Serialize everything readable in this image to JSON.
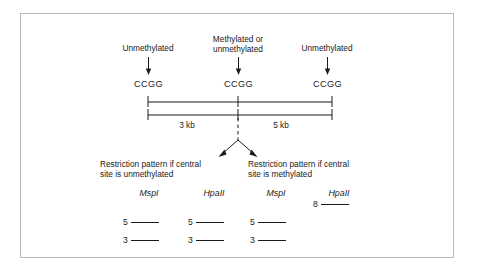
{
  "figure": {
    "type": "diagram",
    "background_color": "#ffffff",
    "frame_color": "#b9b9b9",
    "ink_color": "#1a1a1a"
  },
  "site_labels": [
    {
      "id": "left",
      "text": "Unmethylated"
    },
    {
      "id": "center",
      "text": "Methylated or\nunmethylated"
    },
    {
      "id": "right",
      "text": "Unmethylated"
    }
  ],
  "sites": [
    {
      "id": "site-left",
      "sequence": "CCGG"
    },
    {
      "id": "site-center",
      "sequence": "CCGG"
    },
    {
      "id": "site-right",
      "sequence": "CCGG"
    }
  ],
  "distances": [
    {
      "id": "left-segment",
      "label": "3 kb",
      "value": 3,
      "unit": "kb"
    },
    {
      "id": "right-segment",
      "label": "5 kb",
      "value": 5,
      "unit": "kb"
    }
  ],
  "panels": [
    {
      "id": "unmethylated-panel",
      "caption": "Restriction pattern if central\nsite is unmethylated",
      "lanes": [
        {
          "id": "unmeth-mspi",
          "enzyme_italic": "Msp",
          "enzyme_roman": "I",
          "bands": [
            {
              "label": "5",
              "size": 5
            },
            {
              "label": "3",
              "size": 3
            }
          ]
        },
        {
          "id": "unmeth-hpaii",
          "enzyme_italic": "Hpa",
          "enzyme_roman": "II",
          "bands": [
            {
              "label": "5",
              "size": 5
            },
            {
              "label": "3",
              "size": 3
            }
          ]
        }
      ]
    },
    {
      "id": "methylated-panel",
      "caption": "Restriction pattern if central\nsite is methylated",
      "lanes": [
        {
          "id": "meth-mspi",
          "enzyme_italic": "Msp",
          "enzyme_roman": "I",
          "bands": [
            {
              "label": "5",
              "size": 5
            },
            {
              "label": "3",
              "size": 3
            }
          ]
        },
        {
          "id": "meth-hpaii",
          "enzyme_italic": "Hpa",
          "enzyme_roman": "II",
          "bands": [
            {
              "label": "8",
              "size": 8
            }
          ]
        }
      ]
    }
  ]
}
